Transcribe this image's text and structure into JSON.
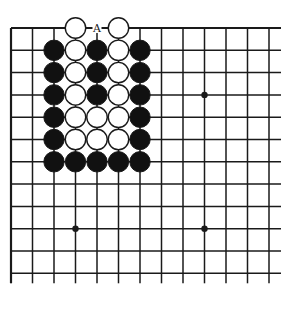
{
  "diagram": {
    "type": "go-board-fragment",
    "grid": {
      "columns": 13,
      "rows": 12,
      "origin_x": 11,
      "origin_y": 28,
      "spacing_x": 21.5,
      "spacing_y": 22.3,
      "right_extension": 12,
      "bottom_extension": 10,
      "edges": {
        "top": "closed",
        "left": "closed",
        "right": "open",
        "bottom": "open"
      }
    },
    "colors": {
      "line": "#1a1a1a",
      "black_stone": "#111111",
      "white_stone": "#ffffff",
      "background": "#ffffff"
    },
    "star_points": [
      {
        "col": 9,
        "row": 3
      },
      {
        "col": 3,
        "row": 9
      },
      {
        "col": 9,
        "row": 9
      }
    ],
    "stones": [
      {
        "col": 3,
        "row": 0,
        "color": "white"
      },
      {
        "col": 5,
        "row": 0,
        "color": "white"
      },
      {
        "col": 2,
        "row": 1,
        "color": "black"
      },
      {
        "col": 3,
        "row": 1,
        "color": "white"
      },
      {
        "col": 4,
        "row": 1,
        "color": "black"
      },
      {
        "col": 5,
        "row": 1,
        "color": "white"
      },
      {
        "col": 6,
        "row": 1,
        "color": "black"
      },
      {
        "col": 2,
        "row": 2,
        "color": "black"
      },
      {
        "col": 3,
        "row": 2,
        "color": "white"
      },
      {
        "col": 4,
        "row": 2,
        "color": "black"
      },
      {
        "col": 5,
        "row": 2,
        "color": "white"
      },
      {
        "col": 6,
        "row": 2,
        "color": "black"
      },
      {
        "col": 2,
        "row": 3,
        "color": "black"
      },
      {
        "col": 3,
        "row": 3,
        "color": "white"
      },
      {
        "col": 4,
        "row": 3,
        "color": "black"
      },
      {
        "col": 5,
        "row": 3,
        "color": "white"
      },
      {
        "col": 6,
        "row": 3,
        "color": "black"
      },
      {
        "col": 2,
        "row": 4,
        "color": "black"
      },
      {
        "col": 3,
        "row": 4,
        "color": "white"
      },
      {
        "col": 4,
        "row": 4,
        "color": "white"
      },
      {
        "col": 5,
        "row": 4,
        "color": "white"
      },
      {
        "col": 6,
        "row": 4,
        "color": "black"
      },
      {
        "col": 2,
        "row": 5,
        "color": "black"
      },
      {
        "col": 3,
        "row": 5,
        "color": "white"
      },
      {
        "col": 4,
        "row": 5,
        "color": "white"
      },
      {
        "col": 5,
        "row": 5,
        "color": "white"
      },
      {
        "col": 6,
        "row": 5,
        "color": "black"
      },
      {
        "col": 2,
        "row": 6,
        "color": "black"
      },
      {
        "col": 3,
        "row": 6,
        "color": "black"
      },
      {
        "col": 4,
        "row": 6,
        "color": "black"
      },
      {
        "col": 5,
        "row": 6,
        "color": "black"
      },
      {
        "col": 6,
        "row": 6,
        "color": "black"
      }
    ],
    "labels": [
      {
        "col": 4,
        "row": 0,
        "text": "A"
      }
    ]
  }
}
